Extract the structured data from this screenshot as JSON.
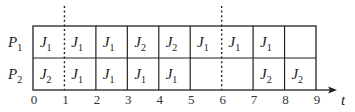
{
  "chart_data": {
    "type": "table",
    "title": "",
    "xlabel": "t",
    "x_ticks": [
      "0",
      "1",
      "2",
      "3",
      "4",
      "5",
      "6",
      "7",
      "8",
      "9"
    ],
    "xlim": [
      0,
      9
    ],
    "rows": [
      {
        "processor": "P",
        "sub": "1",
        "cells": [
          {
            "job": "J",
            "sub": "1"
          },
          {
            "job": "J",
            "sub": "1"
          },
          {
            "job": "J",
            "sub": "1"
          },
          {
            "job": "J",
            "sub": "2"
          },
          {
            "job": "J",
            "sub": "2"
          },
          {
            "job": "J",
            "sub": "1"
          },
          {
            "job": "J",
            "sub": "1"
          },
          {
            "job": "J",
            "sub": "1"
          },
          {
            "job": "",
            "sub": ""
          }
        ]
      },
      {
        "processor": "P",
        "sub": "2",
        "cells": [
          {
            "job": "J",
            "sub": "2"
          },
          {
            "job": "J",
            "sub": "1"
          },
          {
            "job": "J",
            "sub": "1"
          },
          {
            "job": "J",
            "sub": "1"
          },
          {
            "job": "J",
            "sub": "1"
          },
          {
            "job": "",
            "sub": ""
          },
          {
            "job": "",
            "sub": ""
          },
          {
            "job": "J",
            "sub": "2"
          },
          {
            "job": "J",
            "sub": "2"
          }
        ]
      }
    ],
    "solid_separators": [
      2,
      3,
      4,
      5,
      7,
      8
    ],
    "dashed_separators": [
      1,
      6
    ],
    "schedule": {
      "P1": [
        "J1",
        "J1",
        "J1",
        "J2",
        "J2",
        "J1",
        "J1",
        "J1",
        ""
      ],
      "P2": [
        "J2",
        "J1",
        "J1",
        "J1",
        "J1",
        "",
        "",
        "J2",
        "J2"
      ]
    }
  },
  "colors": {
    "line": "#222222",
    "text": "#222222",
    "background": "#ffffff"
  }
}
